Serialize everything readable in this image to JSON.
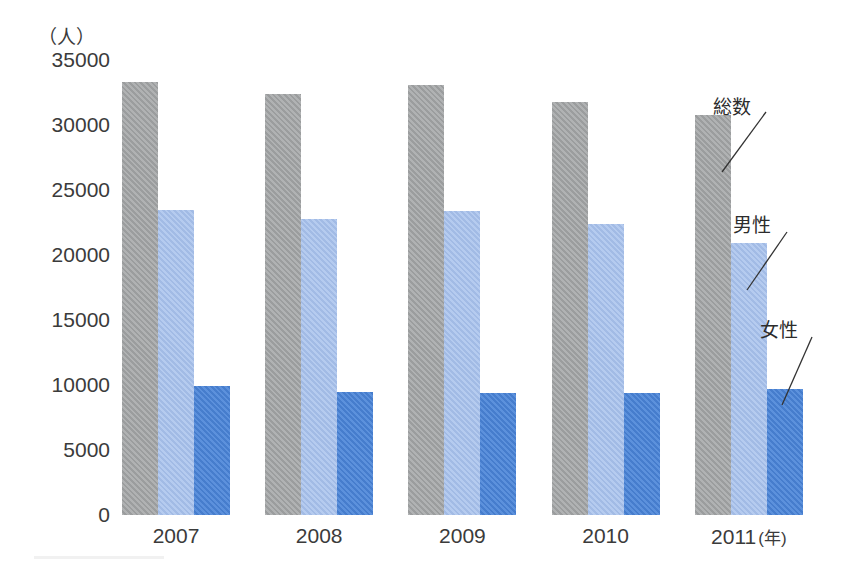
{
  "chart_data": {
    "type": "bar",
    "title": "",
    "subtitle": "",
    "xlabel": "年",
    "ylabel": "人",
    "unit_caption": "（人）",
    "x_axis_unit_label": "(年)",
    "categories": [
      "2007",
      "2008",
      "2009",
      "2010",
      "2011"
    ],
    "series": [
      {
        "name": "総数",
        "color": "#a3a5a6",
        "values": [
          33300,
          32400,
          33100,
          31800,
          30800
        ]
      },
      {
        "name": "男性",
        "color": "#a7c1ec",
        "values": [
          23500,
          22800,
          23400,
          22400,
          20900
        ]
      },
      {
        "name": "女性",
        "color": "#4a84d8",
        "values": [
          9900,
          9500,
          9400,
          9400,
          9700
        ]
      }
    ],
    "ylim": [
      0,
      35000
    ],
    "yticks": [
      35000,
      30000,
      25000,
      20000,
      15000,
      10000,
      5000,
      0
    ],
    "ytick_labels": [
      "35000",
      "30000",
      "25000",
      "20000",
      "15000",
      "10000",
      "5000",
      "0"
    ],
    "grid": false,
    "legend_position": "annotations-right",
    "annotations": [
      {
        "text": "総数",
        "series": "総数",
        "points_to": "2011 total bar"
      },
      {
        "text": "男性",
        "series": "男性",
        "points_to": "2011 male bar"
      },
      {
        "text": "女性",
        "series": "女性",
        "points_to": "2011 female bar"
      }
    ]
  },
  "axis": {
    "unit_caption": "（人）",
    "y_labels": [
      "35000",
      "30000",
      "25000",
      "20000",
      "15000",
      "10000",
      "5000",
      "0"
    ],
    "x_labels": [
      "2007",
      "2008",
      "2009",
      "2010",
      "2011"
    ],
    "x_unit": "(年)"
  },
  "annotations": {
    "total": "総数",
    "male": "男性",
    "female": "女性"
  },
  "colors": {
    "total": "#a3a5a6",
    "male": "#a7c1ec",
    "female": "#4a84d8",
    "text": "#3b3b3b",
    "background": "#ffffff"
  }
}
